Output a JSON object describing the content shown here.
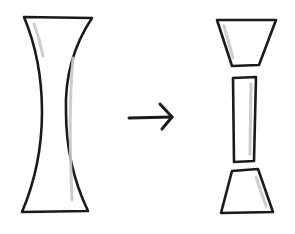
{
  "diagram": {
    "colors": {
      "stroke": "#1a1a1a",
      "shading": "#c8c8c8",
      "fill": "#ffffff",
      "background": "#ffffff"
    },
    "before": {
      "label": "",
      "shape": "tall-concave-column"
    },
    "transition": {
      "symbol": "→",
      "direction": "right"
    },
    "after": {
      "label": "",
      "pieces": [
        {
          "name": "top-trapezoid",
          "shape": "inverted-trapezoid"
        },
        {
          "name": "middle-rectangle",
          "shape": "rectangle"
        },
        {
          "name": "bottom-trapezoid",
          "shape": "trapezoid"
        }
      ]
    }
  }
}
